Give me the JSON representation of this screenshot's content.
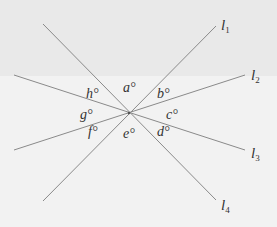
{
  "diagram": {
    "center": {
      "x": 129,
      "y": 113
    },
    "lines": [
      {
        "id": "l1",
        "name": "l",
        "sub": "1",
        "from": {
          "x": 43,
          "y": 201
        },
        "to": {
          "x": 216,
          "y": 26
        },
        "label_pos": {
          "x": 221,
          "y": 18
        }
      },
      {
        "id": "l2",
        "name": "l",
        "sub": "2",
        "from": {
          "x": 14,
          "y": 150
        },
        "to": {
          "x": 245,
          "y": 75
        },
        "label_pos": {
          "x": 251,
          "y": 68
        }
      },
      {
        "id": "l3",
        "name": "l",
        "sub": "3",
        "from": {
          "x": 14,
          "y": 75
        },
        "to": {
          "x": 245,
          "y": 150
        },
        "label_pos": {
          "x": 251,
          "y": 146
        }
      },
      {
        "id": "l4",
        "name": "l",
        "sub": "4",
        "from": {
          "x": 43,
          "y": 24
        },
        "to": {
          "x": 216,
          "y": 200
        },
        "label_pos": {
          "x": 221,
          "y": 198
        }
      }
    ],
    "angles": [
      {
        "label": "a°",
        "x": 123,
        "y": 81
      },
      {
        "label": "b°",
        "x": 157,
        "y": 87
      },
      {
        "label": "c°",
        "x": 166,
        "y": 108
      },
      {
        "label": "d°",
        "x": 157,
        "y": 125
      },
      {
        "label": "e°",
        "x": 123,
        "y": 127
      },
      {
        "label": "f°",
        "x": 88,
        "y": 125
      },
      {
        "label": "g°",
        "x": 80,
        "y": 108
      },
      {
        "label": "h°",
        "x": 86,
        "y": 87
      }
    ],
    "colors": {
      "line": "#8a8a8a",
      "text": "#333333",
      "background": "#f1f1f1"
    }
  }
}
